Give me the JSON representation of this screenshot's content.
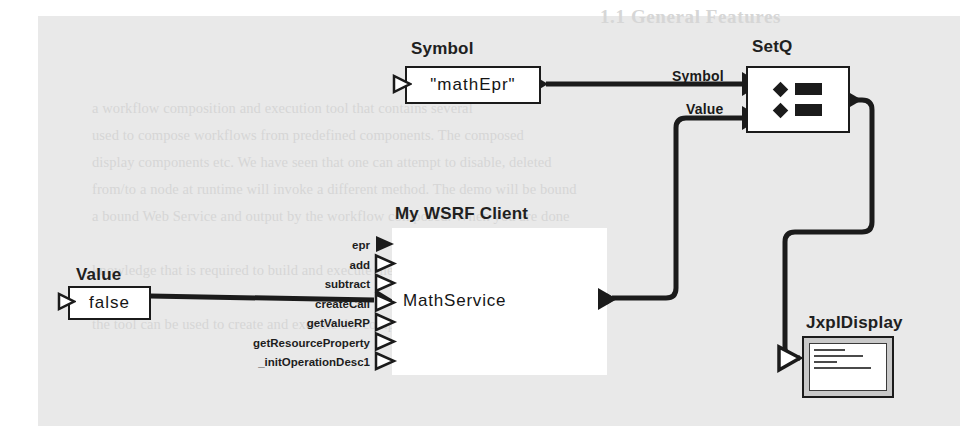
{
  "diagram": {
    "type": "dataflow-workflow",
    "background_color": "#e9e9e9",
    "line_color": "#1b1b1b"
  },
  "nodes": {
    "symbol_const": {
      "title": "Symbol",
      "value": "\"mathEpr\"",
      "input_port": "hollow-triangle",
      "output_port": "filled-arrow"
    },
    "value_const": {
      "title": "Value",
      "value": "false",
      "input_port": "hollow-triangle",
      "output_port": "filled-arrow"
    },
    "setq": {
      "title": "SetQ",
      "glyph": "two-rows-diamond-bar",
      "inputs": [
        "Symbol",
        "Value"
      ],
      "output_port": "filled-arrow"
    },
    "wsrf_client": {
      "title": "My WSRF Client",
      "body_label": "MathService",
      "ports": [
        {
          "label": "epr",
          "style": "filled"
        },
        {
          "label": "add",
          "style": "hollow"
        },
        {
          "label": "subtract",
          "style": "hollow"
        },
        {
          "label": "createCall",
          "style": "hollow"
        },
        {
          "label": "getValueRP",
          "style": "hollow"
        },
        {
          "label": "getResourceProperty",
          "style": "hollow"
        },
        {
          "label": "_initOperationDesc1",
          "style": "hollow"
        }
      ],
      "output_port": "filled-arrow"
    },
    "jxpl_display": {
      "title": "JxplDisplay",
      "icon": "monitor-screen-icon",
      "input_port": "hollow-triangle"
    }
  },
  "wire_labels": {
    "symbol": "Symbol",
    "value": "Value"
  },
  "background_ghost_text": {
    "heading": "1.1 General Features",
    "lines": [
      "a workflow composition and execution tool that contains several",
      "used to compose workflows from predefined components. The composed",
      "display components etc. We have seen that one can attempt to disable, deleted",
      "from/to a node at runtime will invoke a different method. The demo will be bound",
      "a bound Web Service and output by the workflow composed. When you are done",
      "knowledge that is required to build and execute the workflow from the component",
      "the tool can be used to create and execute the composed workflow."
    ]
  }
}
